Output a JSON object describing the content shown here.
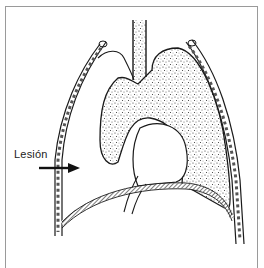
{
  "figure": {
    "annotation": {
      "label": "Lesión",
      "arrow": "right-arrow"
    },
    "colors": {
      "frame": "#9a9a9a",
      "ink": "#1a1a1a",
      "stipple": "#444444",
      "background": "#ffffff"
    }
  }
}
